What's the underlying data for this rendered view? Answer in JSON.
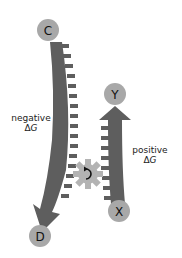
{
  "diagram": {
    "type": "coupled-reaction",
    "colors": {
      "band": "#5e5e5e",
      "circle_fill": "#a8a8a8",
      "circle_letter": "#111111",
      "gear": "#b3b3b3",
      "gear_arrow": "#111111",
      "text": "#222222",
      "background": "#ffffff"
    },
    "nodes": {
      "C": {
        "label": "C"
      },
      "D": {
        "label": "D"
      },
      "X": {
        "label": "X"
      },
      "Y": {
        "label": "Y"
      }
    },
    "labels": {
      "negative": {
        "line1": "negative",
        "delta": "Δ",
        "var": "G"
      },
      "positive": {
        "line1": "positive",
        "delta": "Δ",
        "var": "G"
      }
    },
    "icons": {
      "gear": "gear-icon",
      "rotation": "counterclockwise-arrow-icon"
    },
    "edges": [
      {
        "from": "C",
        "to": "D",
        "label": "negative ΔG",
        "direction": "down"
      },
      {
        "from": "X",
        "to": "Y",
        "label": "positive ΔG",
        "direction": "up"
      }
    ]
  }
}
